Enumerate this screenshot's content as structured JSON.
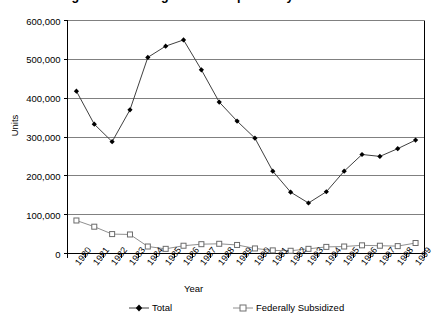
{
  "title": "Figure 1. Housing Units Completed by Year",
  "axis": {
    "ylabel": "Units",
    "xlabel": "Year",
    "ytick_labels": [
      "600,000",
      "500,000",
      "400,000",
      "300,000",
      "200,000",
      "100,000",
      "0"
    ]
  },
  "legend": {
    "entries": [
      {
        "label": "Total",
        "marker": "filled-diamond",
        "color": "#000000"
      },
      {
        "label": "Federally Subsidized",
        "marker": "open-square",
        "color": "#808080"
      }
    ]
  },
  "colors": {
    "total_line": "#404040",
    "subsidized_line": "#909090",
    "gridline": "#808080",
    "axis": "#000000",
    "background": "#ffffff"
  },
  "chart_data": {
    "type": "line",
    "title": "Figure 1. Housing Units Completed by Year",
    "xlabel": "Year",
    "ylabel": "Units",
    "ylim": [
      0,
      600000
    ],
    "ytick_values": [
      0,
      100000,
      200000,
      300000,
      400000,
      500000,
      600000
    ],
    "grid": true,
    "legend_position": "bottom",
    "categories": [
      "1980",
      "1981",
      "1982",
      "1983",
      "1984",
      "1985",
      "1986",
      "1987",
      "1988",
      "1989",
      "1990",
      "1991",
      "1992",
      "1993",
      "1994",
      "1995",
      "1996",
      "1997",
      "1998",
      "1999"
    ],
    "series": [
      {
        "name": "Total",
        "marker": "filled-diamond",
        "values": [
          418000,
          333000,
          288000,
          370000,
          505000,
          534000,
          550000,
          473000,
          390000,
          341000,
          297000,
          212000,
          158000,
          130000,
          159000,
          212000,
          255000,
          250000,
          270000,
          292000
        ]
      },
      {
        "name": "Federally Subsidized",
        "marker": "open-square",
        "values": [
          85000,
          69000,
          50000,
          49000,
          18000,
          12000,
          20000,
          24000,
          25000,
          22000,
          13000,
          8000,
          7000,
          12000,
          17000,
          18000,
          21000,
          20000,
          19000,
          27000
        ]
      }
    ]
  }
}
